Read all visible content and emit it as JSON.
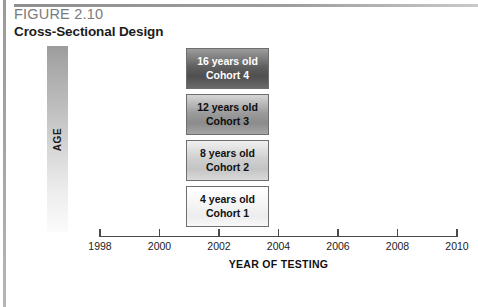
{
  "figure": {
    "number": "FIGURE 2.10",
    "title": "Cross-Sectional Design",
    "caption": ""
  },
  "y_axis": {
    "label": "AGE"
  },
  "x_axis": {
    "title": "YEAR OF TESTING"
  },
  "chart_data": {
    "type": "bar",
    "title": "Cross-Sectional Design",
    "xlabel": "YEAR OF TESTING",
    "ylabel": "AGE",
    "xlim": [
      1998,
      2010
    ],
    "grid": false,
    "legend": "none",
    "xticks": [
      "1998",
      "2000",
      "2002",
      "2004",
      "2006",
      "2008",
      "2010"
    ],
    "annotations": [
      "All four cohorts are tested at the same point in time (approximately 2002)",
      "Box shading darkens with increasing cohort age"
    ],
    "cohorts": [
      {
        "id": "cohort-4",
        "age_label": "16 years old",
        "cohort_label": "Cohort 4",
        "age_years": 16,
        "test_year": 2002,
        "shade": "#4f4f4f",
        "text_color": "#ffffff"
      },
      {
        "id": "cohort-3",
        "age_label": "12 years old",
        "cohort_label": "Cohort 3",
        "age_years": 12,
        "test_year": 2002,
        "shade": "#8b8b8b",
        "text_color": "#0d0d0d"
      },
      {
        "id": "cohort-2",
        "age_label": "8 years old",
        "cohort_label": "Cohort 2",
        "age_years": 8,
        "test_year": 2002,
        "shade": "#c4c4c4",
        "text_color": "#111111"
      },
      {
        "id": "cohort-1",
        "age_label": "4 years old",
        "cohort_label": "Cohort 1",
        "age_years": 4,
        "test_year": 2002,
        "shade": "#f4f4f4",
        "text_color": "#111111"
      }
    ]
  },
  "colors": {
    "rule": "#9a9a9a",
    "axis": "#4a4a4a",
    "figure_number": "#7b7b7b",
    "text": "#111111"
  }
}
